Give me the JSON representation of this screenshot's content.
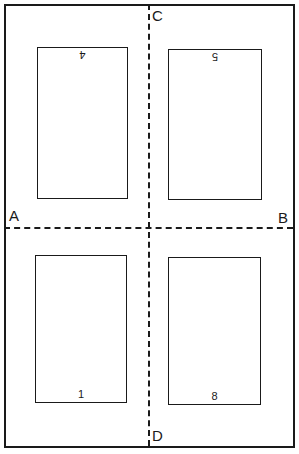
{
  "diagram": {
    "fold_labels": {
      "left": "A",
      "right": "B",
      "top": "C",
      "bottom": "D"
    },
    "pages": [
      {
        "position": "top-left",
        "number": "4",
        "orientation": "upside-down"
      },
      {
        "position": "top-right",
        "number": "5",
        "orientation": "upside-down"
      },
      {
        "position": "bottom-left",
        "number": "1",
        "orientation": "upright"
      },
      {
        "position": "bottom-right",
        "number": "8",
        "orientation": "upright"
      }
    ],
    "colors": {
      "line": "#1a1a1a",
      "background": "#ffffff"
    }
  }
}
